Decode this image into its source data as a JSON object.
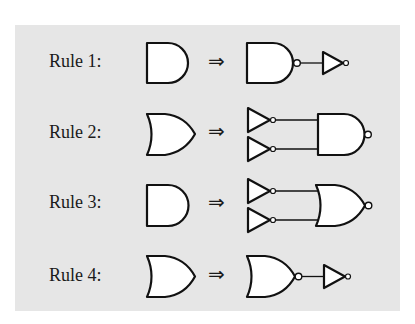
{
  "diagram": {
    "background": "#e6e6e6",
    "rules": [
      {
        "label": "Rule 1:",
        "arrow": "⇒",
        "from": "AND gate",
        "to": [
          "NAND gate",
          "NOT gate"
        ]
      },
      {
        "label": "Rule 2:",
        "arrow": "⇒",
        "from": "OR gate",
        "to": [
          "NOT gate",
          "NOT gate",
          "NAND gate"
        ]
      },
      {
        "label": "Rule 3:",
        "arrow": "⇒",
        "from": "AND gate",
        "to": [
          "NOT gate",
          "NOT gate",
          "NOR gate"
        ]
      },
      {
        "label": "Rule 4:",
        "arrow": "⇒",
        "from": "OR gate",
        "to": [
          "NOR gate",
          "NOT gate"
        ]
      }
    ]
  }
}
